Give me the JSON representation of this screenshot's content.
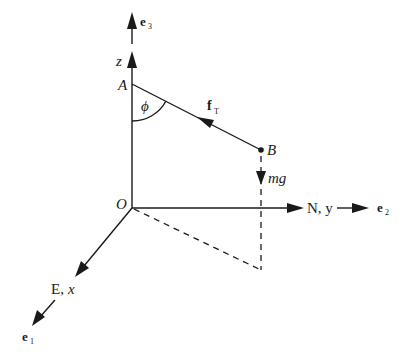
{
  "diagram": {
    "type": "3D coordinate force diagram",
    "points": {
      "origin": "O",
      "top": "A",
      "end": "B"
    },
    "axes": {
      "z": {
        "label": "z",
        "unit_vector_main": "e",
        "unit_vector_sub": "3"
      },
      "y": {
        "label": "N, y",
        "unit_vector_main": "e",
        "unit_vector_sub": "2"
      },
      "x": {
        "label_prefix": "E, ",
        "label_var": "x",
        "unit_vector_main": "e",
        "unit_vector_sub": "1"
      }
    },
    "forces": {
      "tension": {
        "main": "f",
        "sub": "T"
      },
      "gravity": {
        "label": "mg"
      }
    },
    "angle": {
      "label": "ϕ"
    },
    "colors": {
      "ink": "#1a1a1a",
      "background": "#ffffff"
    }
  }
}
